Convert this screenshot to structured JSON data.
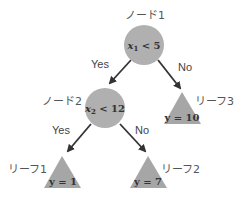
{
  "colors": {
    "node_fill": "#b0b0b0",
    "leaf_fill": "#a6a6a6",
    "edge": "#333333"
  },
  "nodes": [
    {
      "id": "node1",
      "label": "ノード1",
      "condition_var": "x",
      "condition_sub": "1",
      "condition_rest": " < 5"
    },
    {
      "id": "node2",
      "label": "ノード2",
      "condition_var": "x",
      "condition_sub": "2",
      "condition_rest": " < 12"
    }
  ],
  "leaves": [
    {
      "id": "leaf1",
      "label": "リーフ1",
      "value": "y = 1"
    },
    {
      "id": "leaf2",
      "label": "リーフ2",
      "value": "y = 7"
    },
    {
      "id": "leaf3",
      "label": "リーフ3",
      "value": "y = 10"
    }
  ],
  "edges": [
    {
      "from": "node1",
      "to": "node2",
      "label": "Yes"
    },
    {
      "from": "node1",
      "to": "leaf3",
      "label": "No"
    },
    {
      "from": "node2",
      "to": "leaf1",
      "label": "Yes"
    },
    {
      "from": "node2",
      "to": "leaf2",
      "label": "No"
    }
  ]
}
